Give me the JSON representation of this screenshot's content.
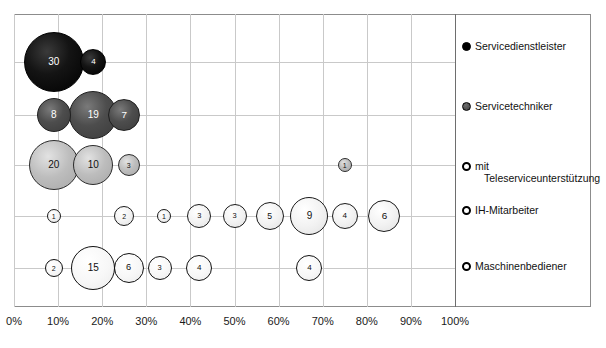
{
  "chart": {
    "title": "",
    "xaxis": {
      "ticks": [
        "0%",
        "10%",
        "20%",
        "30%",
        "40%",
        "50%",
        "60%",
        "70%",
        "80%",
        "90%",
        "100%"
      ]
    }
  },
  "legend": {
    "items": [
      {
        "key": "servicedienstleister",
        "label": "Servicedienstleister",
        "marker": "filled-black-circle-icon"
      },
      {
        "key": "servicetechniker",
        "label": "Servicetechniker",
        "marker": "filled-gray-circle-icon"
      },
      {
        "key": "teleservice",
        "label": "mit",
        "label2": "Teleserviceunterstützung",
        "marker": "open-circle-icon"
      },
      {
        "key": "ih-mitarbeiter",
        "label": "IH-Mitarbeiter",
        "marker": "open-circle-icon"
      },
      {
        "key": "maschinenbediener",
        "label": "Maschinenbediener",
        "marker": "open-circle-icon"
      }
    ]
  },
  "chart_data": {
    "type": "scatter",
    "title": "",
    "xlabel": "",
    "ylabel": "",
    "xlim": [
      0,
      100
    ],
    "xticks": [
      0,
      10,
      20,
      30,
      40,
      50,
      60,
      70,
      80,
      90,
      100
    ],
    "grid": true,
    "legend_position": "right",
    "bubble_value_is_label": true,
    "categories": [
      "Servicedienstleister",
      "Servicetechniker",
      "mit Teleserviceunterstützung",
      "IH-Mitarbeiter",
      "Maschinenbediener"
    ],
    "series": [
      {
        "name": "Servicedienstleister",
        "color": "#000000",
        "row": 0,
        "points": [
          {
            "x": 9,
            "value": 30,
            "r": 30
          },
          {
            "x": 18,
            "value": 4,
            "r": 13
          }
        ]
      },
      {
        "name": "Servicetechniker",
        "color": "#444444",
        "row": 1,
        "points": [
          {
            "x": 9,
            "value": 8,
            "r": 17
          },
          {
            "x": 18,
            "value": 19,
            "r": 24
          },
          {
            "x": 25,
            "value": 7,
            "r": 16
          }
        ]
      },
      {
        "name": "mit Teleserviceunterstützung",
        "color": "#bdbdbd",
        "row": 2,
        "points": [
          {
            "x": 9,
            "value": 20,
            "r": 25
          },
          {
            "x": 18,
            "value": 10,
            "r": 20
          },
          {
            "x": 26,
            "value": 3,
            "r": 11
          },
          {
            "x": 75,
            "value": 1,
            "r": 7
          }
        ]
      },
      {
        "name": "IH-Mitarbeiter",
        "color": "#f2f2f2",
        "row": 3,
        "points": [
          {
            "x": 9,
            "value": 1,
            "r": 7
          },
          {
            "x": 25,
            "value": 2,
            "r": 10
          },
          {
            "x": 34,
            "value": 1,
            "r": 7
          },
          {
            "x": 42,
            "value": 3,
            "r": 12
          },
          {
            "x": 50,
            "value": 3,
            "r": 12
          },
          {
            "x": 58,
            "value": 5,
            "r": 14
          },
          {
            "x": 67,
            "value": 9,
            "r": 19
          },
          {
            "x": 75,
            "value": 4,
            "r": 13
          },
          {
            "x": 84,
            "value": 6,
            "r": 16
          }
        ]
      },
      {
        "name": "Maschinenbediener",
        "color": "#ffffff",
        "row": 4,
        "points": [
          {
            "x": 9,
            "value": 2,
            "r": 9
          },
          {
            "x": 18,
            "value": 15,
            "r": 22
          },
          {
            "x": 26,
            "value": 6,
            "r": 15
          },
          {
            "x": 33,
            "value": 3,
            "r": 12
          },
          {
            "x": 42,
            "value": 4,
            "r": 13
          },
          {
            "x": 67,
            "value": 4,
            "r": 13
          }
        ]
      }
    ]
  },
  "geometry": {
    "plot_left": 14,
    "plot_top": 14,
    "plot_width": 441,
    "plot_height": 293,
    "x0_px": 14,
    "x_step_px": 44.1,
    "row_y_px": [
      48,
      101,
      151,
      202,
      254
    ],
    "legend_y_px": [
      26,
      86,
      146,
      190,
      246
    ]
  }
}
